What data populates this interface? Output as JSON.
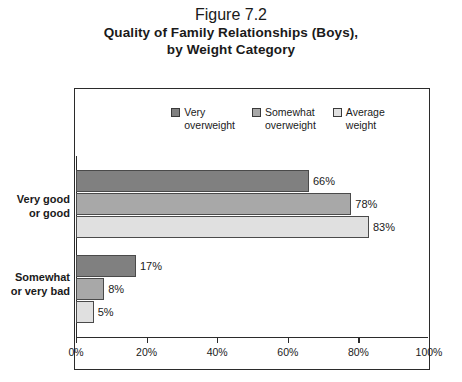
{
  "title": {
    "figure_number": "Figure 7.2",
    "line1": "Quality of Family Relationships (Boys),",
    "line2": "by Weight Category"
  },
  "legend": {
    "items": [
      {
        "label": "Very\noverweight",
        "color": "#808080",
        "name": "legend-very-overweight"
      },
      {
        "label": "Somewhat\noverweight",
        "color": "#a8a8a8",
        "name": "legend-somewhat-overweight"
      },
      {
        "label": "Average\nweight",
        "color": "#e0e0e0",
        "name": "legend-average-weight"
      }
    ]
  },
  "axis": {
    "ticks": [
      "0%",
      "20%",
      "40%",
      "60%",
      "80%",
      "100%"
    ]
  },
  "categories": [
    {
      "label": "Very good\nor good"
    },
    {
      "label": "Somewhat\nor very bad"
    }
  ],
  "bars": [
    {
      "value": 66,
      "label": "66%",
      "color": "#808080",
      "series": "Very overweight",
      "category": "Very good or good"
    },
    {
      "value": 78,
      "label": "78%",
      "color": "#a8a8a8",
      "series": "Somewhat overweight",
      "category": "Very good or good"
    },
    {
      "value": 83,
      "label": "83%",
      "color": "#e0e0e0",
      "series": "Average weight",
      "category": "Very good or good"
    },
    {
      "value": 17,
      "label": "17%",
      "color": "#808080",
      "series": "Very overweight",
      "category": "Somewhat or very bad"
    },
    {
      "value": 8,
      "label": "8%",
      "color": "#a8a8a8",
      "series": "Somewhat overweight",
      "category": "Somewhat or very bad"
    },
    {
      "value": 5,
      "label": "5%",
      "color": "#e0e0e0",
      "series": "Average weight",
      "category": "Somewhat or very bad"
    }
  ],
  "chart_data": {
    "type": "bar",
    "orientation": "horizontal",
    "title": "Figure 7.2 Quality of Family Relationships (Boys), by Weight Category",
    "subtitle": "by Weight Category",
    "xlabel": "",
    "ylabel": "",
    "xlim": [
      0,
      100
    ],
    "xticks": [
      0,
      20,
      40,
      60,
      80,
      100
    ],
    "xticklabels": [
      "0%",
      "20%",
      "40%",
      "60%",
      "80%",
      "100%"
    ],
    "grid": false,
    "legend_position": "top-center",
    "categories": [
      "Very good or good",
      "Somewhat or very bad"
    ],
    "series": [
      {
        "name": "Very overweight",
        "color": "#808080",
        "values": [
          66,
          17
        ]
      },
      {
        "name": "Somewhat overweight",
        "color": "#a8a8a8",
        "values": [
          78,
          8
        ]
      },
      {
        "name": "Average weight",
        "color": "#e0e0e0",
        "values": [
          83,
          5
        ]
      }
    ],
    "data_labels": [
      "66%",
      "78%",
      "83%",
      "17%",
      "8%",
      "5%"
    ],
    "units": "percent"
  }
}
